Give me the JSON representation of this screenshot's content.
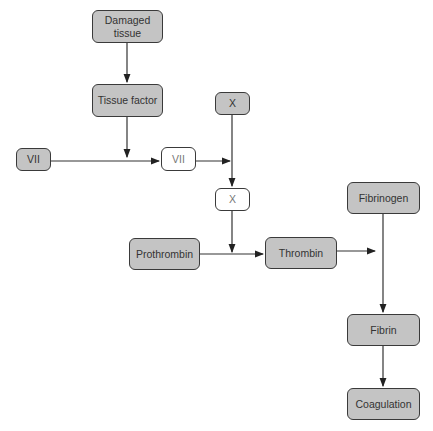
{
  "diagram": {
    "title": "",
    "nodes": [
      {
        "id": "damaged_tissue",
        "label": "Damaged tissue",
        "style": "gray"
      },
      {
        "id": "tissue_factor",
        "label": "Tissue factor",
        "style": "gray"
      },
      {
        "id": "vii_in",
        "label": "VII",
        "style": "gray"
      },
      {
        "id": "vii_active",
        "label": "VII",
        "style": "white"
      },
      {
        "id": "x_in",
        "label": "X",
        "style": "gray"
      },
      {
        "id": "x_active",
        "label": "X",
        "style": "white"
      },
      {
        "id": "prothrombin",
        "label": "Prothrombin",
        "style": "gray"
      },
      {
        "id": "thrombin",
        "label": "Thrombin",
        "style": "gray"
      },
      {
        "id": "fibrinogen",
        "label": "Fibrinogen",
        "style": "gray"
      },
      {
        "id": "fibrin",
        "label": "Fibrin",
        "style": "gray"
      },
      {
        "id": "coagulation",
        "label": "Coagulation",
        "style": "gray"
      }
    ],
    "edges": [
      {
        "from": "damaged_tissue",
        "to": "tissue_factor"
      },
      {
        "from": "tissue_factor",
        "to": "vii_in->vii_active"
      },
      {
        "from": "vii_in",
        "to": "vii_active"
      },
      {
        "from": "vii_active",
        "to": "x_in->x_active"
      },
      {
        "from": "x_in",
        "to": "x_active"
      },
      {
        "from": "x_active",
        "to": "prothrombin->thrombin"
      },
      {
        "from": "prothrombin",
        "to": "thrombin"
      },
      {
        "from": "thrombin",
        "to": "fibrinogen->fibrin"
      },
      {
        "from": "fibrinogen",
        "to": "fibrin"
      },
      {
        "from": "fibrin",
        "to": "coagulation"
      }
    ],
    "colors": {
      "node_fill": "#c4c4c4",
      "node_border": "#3a3a3a",
      "active_fill": "#ffffff",
      "line": "#333333"
    }
  }
}
